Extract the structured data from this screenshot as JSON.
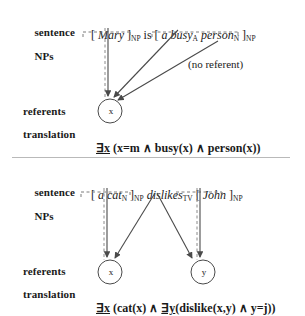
{
  "figure": {
    "separator": "horizontal-rule"
  },
  "panels": [
    {
      "id": "panel-top",
      "labels": {
        "sentence_line1": "sentence",
        "sentence_line2": "NPs",
        "referents": "referents",
        "translation": "translation"
      },
      "sentence": {
        "full": "[ Mary ]NP is [ a busyA personN ]NP",
        "tokens": [
          {
            "text": "[ ",
            "style": "plain"
          },
          {
            "text": "Mary",
            "style": "italic"
          },
          {
            "text": " ]",
            "style": "plain"
          },
          {
            "text": "NP",
            "style": "subscript"
          },
          {
            "text": " is [ ",
            "style": "plain"
          },
          {
            "text": "a busy",
            "style": "italic"
          },
          {
            "text": "A",
            "style": "subscript"
          },
          {
            "text": " person",
            "style": "italic"
          },
          {
            "text": "N",
            "style": "subscript"
          },
          {
            "text": " ]",
            "style": "plain"
          },
          {
            "text": "NP",
            "style": "subscript"
          }
        ]
      },
      "annotation": "(no referent)",
      "referents": [
        {
          "id": "x",
          "label": "x"
        }
      ],
      "translation": {
        "quantifier": "∃x",
        "body": " (x=m ∧ busy(x) ∧ person(x))"
      },
      "braces": [
        {
          "name": "brace-mary",
          "span": "Mary"
        },
        {
          "name": "brace-a-busy-person",
          "span": "a busy person"
        }
      ],
      "arrows": [
        {
          "name": "arrow-mary-to-x",
          "from": "brace-mary",
          "to": "x",
          "style": "dashed-vertical"
        },
        {
          "name": "arrow-busy-to-x",
          "from": "busy",
          "to": "x",
          "style": "solid-diagonal"
        },
        {
          "name": "arrow-person-to-x",
          "from": "person",
          "to": "x",
          "style": "solid-diagonal"
        }
      ]
    },
    {
      "id": "panel-bottom",
      "labels": {
        "sentence_line1": "sentence",
        "sentence_line2": "NPs",
        "referents": "referents",
        "translation": "translation"
      },
      "sentence": {
        "full": "[ a catN ]NP dislikesTV [ John ]NP",
        "tokens": [
          {
            "text": "[ ",
            "style": "plain"
          },
          {
            "text": "a cat",
            "style": "italic"
          },
          {
            "text": "N",
            "style": "subscript"
          },
          {
            "text": " ]",
            "style": "plain"
          },
          {
            "text": "NP",
            "style": "subscript"
          },
          {
            "text": " ",
            "style": "plain"
          },
          {
            "text": "dislikes",
            "style": "italic"
          },
          {
            "text": "TV",
            "style": "subscript"
          },
          {
            "text": " [ ",
            "style": "plain"
          },
          {
            "text": "John",
            "style": "italic"
          },
          {
            "text": " ]",
            "style": "plain"
          },
          {
            "text": "NP",
            "style": "subscript"
          }
        ]
      },
      "annotation": "",
      "referents": [
        {
          "id": "x",
          "label": "x"
        },
        {
          "id": "y",
          "label": "y"
        }
      ],
      "translation": {
        "quantifier": "∃x",
        "body": " (cat(x) ∧ ",
        "quantifier2": "∃y",
        "body2": "(dislike(x,y) ∧ y=j))"
      },
      "braces": [
        {
          "name": "brace-a-cat",
          "span": "a cat"
        },
        {
          "name": "brace-john",
          "span": "John"
        }
      ],
      "arrows": [
        {
          "name": "arrow-a-cat-to-x",
          "from": "brace-a-cat",
          "to": "x",
          "style": "dashed-vertical"
        },
        {
          "name": "arrow-dislikes-to-x",
          "from": "dislikes",
          "to": "x",
          "style": "solid-diagonal"
        },
        {
          "name": "arrow-dislikes-to-y",
          "from": "dislikes",
          "to": "y",
          "style": "solid-diagonal"
        },
        {
          "name": "arrow-john-to-y",
          "from": "brace-john",
          "to": "y",
          "style": "dashed-vertical"
        }
      ]
    }
  ],
  "colors": {
    "ink": "#1a1a1a",
    "line": "#555555",
    "dashed": "#777777",
    "rule": "#b9b9b9",
    "background": "#ffffff"
  }
}
